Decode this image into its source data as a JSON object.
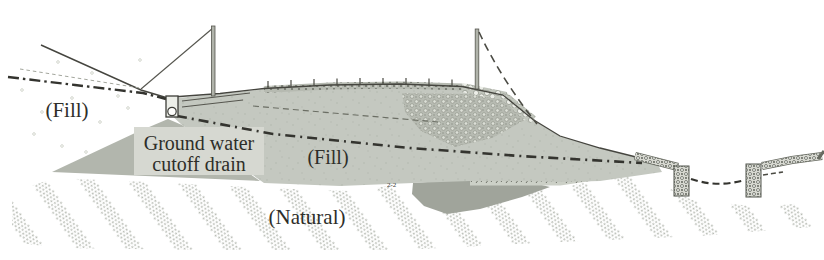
{
  "diagram": {
    "labels": {
      "fill_left": "(Fill)",
      "groundwater_line1": "Ground water",
      "groundwater_line2": "cutoff drain",
      "fill_center": "(Fill)",
      "natural": "(Natural)",
      "section_mark": "2-2"
    },
    "colors": {
      "background": "#ffffff",
      "fill_body": "#c4c8c0",
      "fill_toe_wedge": "#b2b6ad",
      "label_box": "#d6d8d1",
      "natural_deposit": "#a0a49b",
      "hatch_dot": "#b7bbb3",
      "line_dark": "#45453f",
      "dashdot_dark": "#34342f"
    }
  }
}
